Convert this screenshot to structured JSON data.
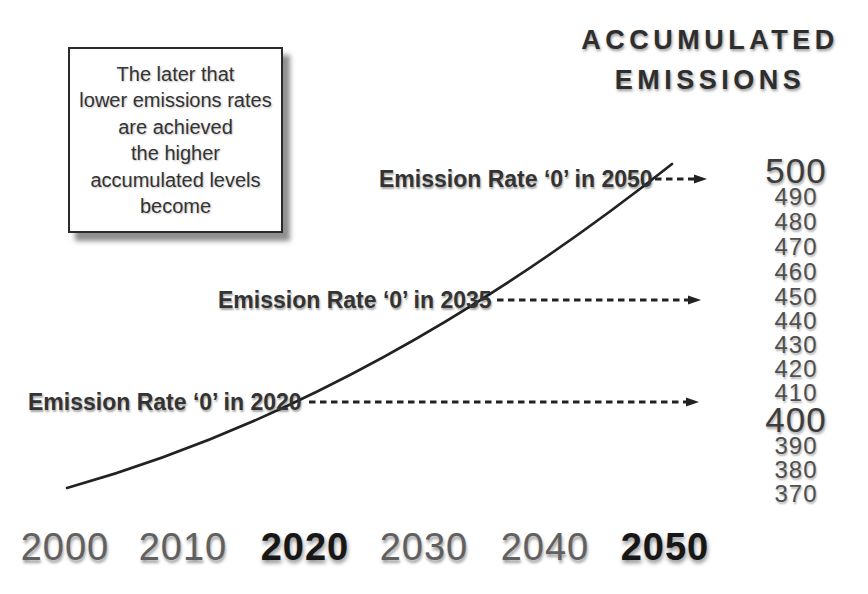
{
  "chart_data": {
    "type": "line",
    "title": "ACCUMULATED EMISSIONS",
    "title_lines": [
      "ACCUMULATED",
      "EMISSIONS"
    ],
    "note_lines": [
      "The later that",
      "lower emissions rates",
      "are achieved",
      "the higher",
      "accumulated levels",
      "become"
    ],
    "x": [
      2000,
      2010,
      2020,
      2030,
      2040,
      2050
    ],
    "x_tick_labels": [
      "2000",
      "2010",
      "2020",
      "2030",
      "2040",
      "2050"
    ],
    "emphasized_x_ticks": [
      "2020",
      "2050"
    ],
    "series": [
      {
        "name": "accumulated-emissions",
        "values": [
          373,
          388,
          409,
          435,
          465,
          500
        ]
      }
    ],
    "ylim": [
      370,
      500
    ],
    "y_tick_labels": [
      "500",
      "490",
      "480",
      "470",
      "460",
      "450",
      "440",
      "430",
      "420",
      "410",
      "400",
      "390",
      "380",
      "370"
    ],
    "emphasized_y_ticks": [
      "500",
      "400"
    ],
    "grid": false,
    "legend": "none",
    "annotations": [
      {
        "label": "Emission Rate ‘0’ in 2050",
        "arrow_points_to_value": 500
      },
      {
        "label": "Emission Rate ‘0’ in 2035",
        "arrow_points_to_value": 450
      },
      {
        "label": "Emission Rate ‘0’ in 2020",
        "arrow_points_to_value": 405
      }
    ]
  },
  "style": {
    "ink_color": "#222222",
    "text_color": "#333333",
    "muted_tick_color": "#606060",
    "background": "#ffffff"
  },
  "layout": {
    "curve": {
      "start": [
        67,
        488
      ],
      "control": [
        370,
        403
      ],
      "end": [
        672,
        164
      ],
      "stroke_width": 2.6
    },
    "arrows": [
      {
        "x1": 655,
        "x2": 707,
        "y": 179
      },
      {
        "x1": 497,
        "x2": 701,
        "y": 300
      },
      {
        "x1": 309,
        "x2": 699,
        "y": 402
      }
    ],
    "annotation_positions": [
      {
        "x": 379,
        "y": 165
      },
      {
        "x": 218,
        "y": 286
      },
      {
        "x": 28,
        "y": 388
      }
    ],
    "x_label_centers": [
      65,
      183,
      305,
      424,
      545,
      665
    ],
    "y_tick_centers": [
      171,
      197,
      222,
      247,
      272,
      297,
      321,
      345,
      369,
      393,
      420,
      446,
      470,
      494
    ]
  }
}
